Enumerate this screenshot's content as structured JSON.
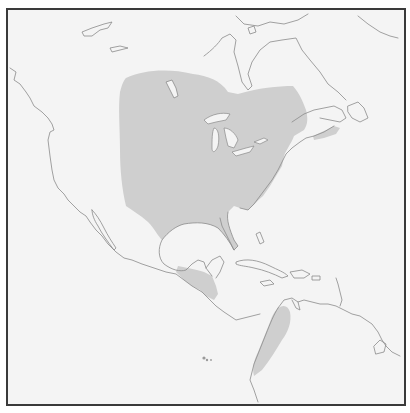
{
  "map": {
    "type": "species range map",
    "region": "North and Central America",
    "colors": {
      "background": "#f4f4f4",
      "range_fill": "#cfcfcf",
      "coastline": "#8a8a8a",
      "border": "#3a3a3a"
    },
    "range_areas": [
      {
        "name": "Eastern and central North America"
      },
      {
        "name": "Nova Scotia"
      },
      {
        "name": "Central America"
      },
      {
        "name": "Northwestern South America"
      }
    ],
    "features": [
      {
        "name": "Great Lakes"
      },
      {
        "name": "Hudson Bay"
      },
      {
        "name": "Caribbean islands"
      },
      {
        "name": "Baja California"
      },
      {
        "name": "Florida"
      },
      {
        "name": "Yucatan Peninsula"
      },
      {
        "name": "Galapagos Islands"
      }
    ]
  }
}
